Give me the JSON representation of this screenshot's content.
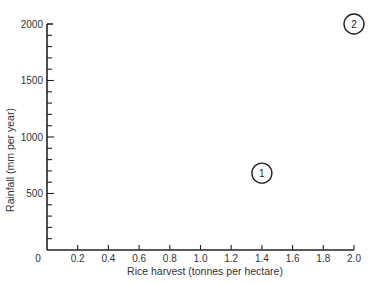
{
  "chart_data": {
    "type": "scatter",
    "title": "",
    "xlabel": "Rice harvest (tonnes per hectare)",
    "ylabel": "Rainfall (mm per year)",
    "xlim": [
      0,
      2.0
    ],
    "ylim": [
      0,
      2000
    ],
    "x_ticks": [
      "0.2",
      "0.4",
      "0.6",
      "0.8",
      "1.0",
      "1.2",
      "1.4",
      "1.6",
      "1.8",
      "2.0"
    ],
    "x_tick_values": [
      0.2,
      0.4,
      0.6,
      0.8,
      1.0,
      1.2,
      1.4,
      1.6,
      1.8,
      2.0
    ],
    "y_ticks": [
      "0",
      "500",
      "1000",
      "1500",
      "2000"
    ],
    "y_tick_values": [
      0,
      500,
      1000,
      1500,
      2000
    ],
    "y_minor_step": 100,
    "grid": false,
    "origin_label": "0",
    "points": [
      {
        "label": "1",
        "x": 1.4,
        "y": 680
      },
      {
        "label": "2",
        "x": 2.0,
        "y": 2000
      }
    ]
  },
  "colors": {
    "axis": "#222222",
    "marker_stroke": "#222222",
    "text": "#333333"
  }
}
